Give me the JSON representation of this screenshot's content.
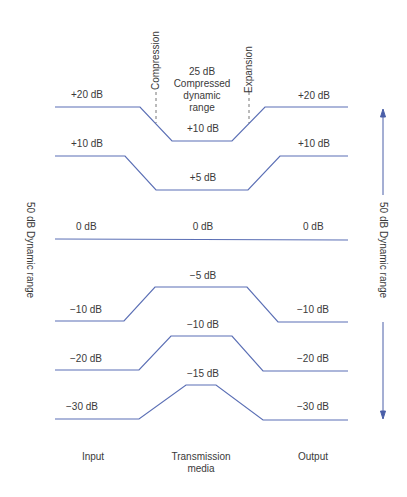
{
  "diagram": {
    "annotations": {
      "compression": "Compression",
      "expansion": "Expansion",
      "compressed_range_line1": "25 dB",
      "compressed_range_line2": "Compressed",
      "compressed_range_line3": "dynamic",
      "compressed_range_line4": "range",
      "left_range": "50 dB Dynamic range",
      "right_range": "50 dB Dynamic range"
    },
    "columns": {
      "input": "Input",
      "media_line1": "Transmission",
      "media_line2": "media",
      "output": "Output"
    },
    "levels": [
      {
        "input": "+20 dB",
        "media": "+10 dB",
        "output": "+20 dB"
      },
      {
        "input": "+10 dB",
        "media": "+5 dB",
        "output": "+10 dB"
      },
      {
        "input": "0 dB",
        "media": "0 dB",
        "output": "0 dB"
      },
      {
        "input": "−10 dB",
        "media": "−5 dB",
        "output": "−10 dB"
      },
      {
        "input": "−20 dB",
        "media": "−10 dB",
        "output": "−20 dB"
      },
      {
        "input": "−30 dB",
        "media": "−15 dB",
        "output": "−30 dB"
      }
    ],
    "line_color": "#4a5fa8",
    "caption": ""
  }
}
